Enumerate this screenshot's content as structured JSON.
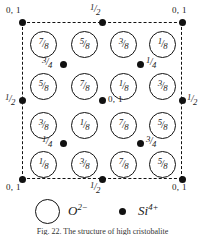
{
  "figure": {
    "cell": {
      "border_style": "dashed",
      "color": "#111111"
    },
    "legend": {
      "oxygen_symbol": "O",
      "oxygen_charge": "2−",
      "silicon_symbol": "Si",
      "silicon_charge": "4+"
    },
    "caption": "Fig. 22. The structure of high cristobalite",
    "oxygen_rows": [
      {
        "row": 1,
        "atoms": [
          {
            "num": "7",
            "den": "8"
          },
          {
            "num": "5",
            "den": "8"
          },
          {
            "num": "3",
            "den": "8"
          },
          {
            "num": "1",
            "den": "8"
          }
        ]
      },
      {
        "row": 2,
        "atoms": [
          {
            "num": "5",
            "den": "8"
          },
          {
            "num": "7",
            "den": "8"
          },
          {
            "num": "1",
            "den": "8"
          },
          {
            "num": "3",
            "den": "8"
          }
        ]
      },
      {
        "row": 3,
        "atoms": [
          {
            "num": "3",
            "den": "8"
          },
          {
            "num": "1",
            "den": "8"
          },
          {
            "num": "7",
            "den": "8"
          },
          {
            "num": "5",
            "den": "8"
          }
        ]
      },
      {
        "row": 4,
        "atoms": [
          {
            "num": "1",
            "den": "8"
          },
          {
            "num": "3",
            "den": "8"
          },
          {
            "num": "7",
            "den": "8"
          },
          {
            "num": "5",
            "den": "8"
          }
        ]
      }
    ],
    "corner_labels": {
      "top_left": "0, 1",
      "top_mid": {
        "num": "1",
        "den": "2"
      },
      "top_right": "0, 1",
      "mid_left": {
        "num": "1",
        "den": "2"
      },
      "mid_right": {
        "num": "1",
        "den": "2"
      },
      "center": "0, 1",
      "bottom_left": "0, 1",
      "bottom_mid": {
        "num": "1",
        "den": "2"
      },
      "bottom_right": "0, 1"
    },
    "interior_si_labels": {
      "upper_left": {
        "num": "3",
        "den": "4"
      },
      "upper_right": {
        "num": "1",
        "den": "4"
      },
      "lower_left": {
        "num": "1",
        "den": "4"
      },
      "lower_right": {
        "num": "3",
        "den": "4"
      }
    }
  }
}
